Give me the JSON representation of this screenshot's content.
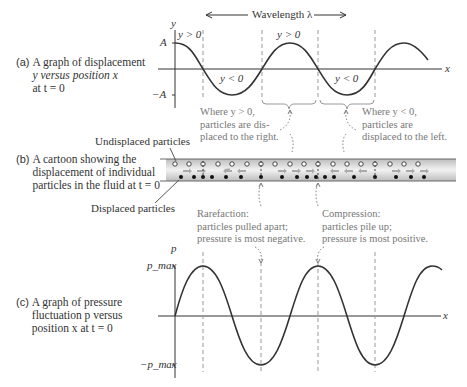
{
  "panel_a": {
    "letter": "(a)",
    "caption_lines": [
      "A graph of displacement",
      "y versus position x",
      "at t = 0"
    ],
    "y_axis_label": "y",
    "x_axis_label": "x",
    "tick_top": "A",
    "tick_bottom": "−A",
    "wavelength_label": "Wavelength λ",
    "region_labels": [
      "y > 0",
      "y < 0",
      "y > 0",
      "y < 0"
    ],
    "note_positive": [
      "Where y > 0,",
      "particles are dis-",
      "placed to the right."
    ],
    "note_negative": [
      "Where y < 0,",
      "particles are",
      "displaced to the left."
    ]
  },
  "panel_b": {
    "letter": "(b)",
    "caption_lines": [
      "A cartoon showing the",
      "displacement of individual",
      "particles in the fluid at t = 0"
    ],
    "undisplaced_label": "Undisplaced particles",
    "displaced_label": "Displaced particles",
    "rarefaction_note": [
      "Rarefaction:",
      "particles pulled apart;",
      "pressure is most negative."
    ],
    "compression_note": [
      "Compression:",
      "particles pile up;",
      "pressure is most positive."
    ],
    "band_color": "#d9d9d9"
  },
  "panel_c": {
    "letter": "(c)",
    "caption_lines": [
      "A graph of pressure",
      "fluctuation p versus",
      "position x at t = 0"
    ],
    "y_axis_label": "p",
    "x_axis_label": "x",
    "tick_top": "p_max",
    "tick_bottom": "−p_max"
  },
  "colors": {
    "curve": "#333333",
    "axis": "#333333",
    "dashed": "#999999",
    "note_text": "#777777"
  }
}
